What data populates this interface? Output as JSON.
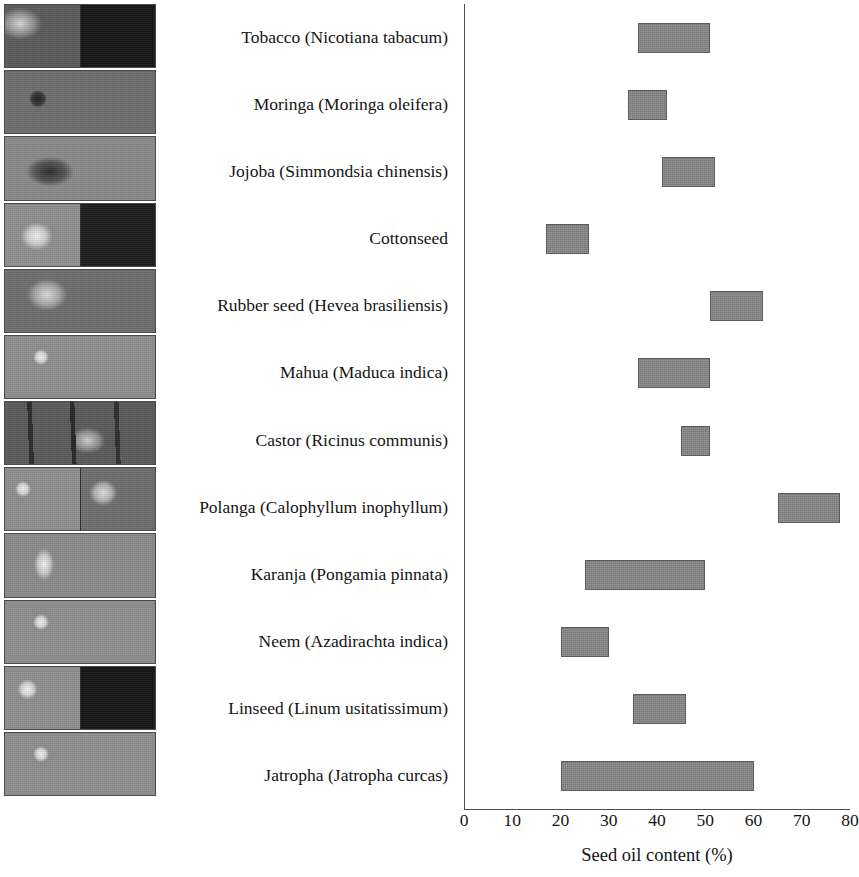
{
  "figure": {
    "kind": "range-bar-chart-with-photo-strip"
  },
  "photo_strip": {
    "name": "seed-and-plant-photographs",
    "cells": [
      {
        "id": "tobacco-photo",
        "panes": [
          "plant",
          "seeds"
        ]
      },
      {
        "id": "moringa-photo",
        "panes": [
          "pod-with-seeds"
        ]
      },
      {
        "id": "jojoba-photo",
        "panes": [
          "branch-with-fruit"
        ]
      },
      {
        "id": "cottonseed-photo",
        "panes": [
          "cotton-boll",
          "seed-pile"
        ]
      },
      {
        "id": "rubber-seed-photo",
        "panes": [
          "seeds-and-shells"
        ]
      },
      {
        "id": "mahua-photo",
        "panes": [
          "fruit-on-branch"
        ]
      },
      {
        "id": "castor-photo",
        "panes": [
          "castor-plant"
        ]
      },
      {
        "id": "polanga-photo",
        "panes": [
          "fruit-on-branch",
          "nuts"
        ]
      },
      {
        "id": "karanja-photo",
        "panes": [
          "pods-on-branch"
        ]
      },
      {
        "id": "neem-photo",
        "panes": [
          "fruit-on-branch"
        ]
      },
      {
        "id": "linseed-photo",
        "panes": [
          "flax-plant",
          "linseed-pile"
        ]
      },
      {
        "id": "jatropha-photo",
        "panes": [
          "fruit-on-branch"
        ]
      }
    ]
  },
  "chart_data": {
    "type": "bar",
    "subtype": "floating-range-bar",
    "title": "",
    "xlabel": "Seed oil content (%)",
    "ylabel": "",
    "xlim": [
      0,
      80
    ],
    "xticks": [
      0,
      10,
      20,
      30,
      40,
      50,
      60,
      70,
      80
    ],
    "xtick_labels": [
      "0",
      "10",
      "20",
      "30",
      "40",
      "50",
      "60",
      "70",
      "80"
    ],
    "grid": false,
    "legend": null,
    "bar_color": "#878787",
    "bar_edge_color": "#5c5c5c",
    "axis_color": "#4f4f4f",
    "categories": [
      "Tobacco (Nicotiana tabacum)",
      "Moringa (Moringa oleifera)",
      "Jojoba (Simmondsia chinensis)",
      "Cottonseed",
      "Rubber seed (Hevea brasiliensis)",
      "Mahua (Maduca indica)",
      "Castor (Ricinus communis)",
      "Polanga (Calophyllum inophyllum)",
      "Karanja (Pongamia pinnata)",
      "Neem (Azadirachta indica)",
      "Linseed (Linum usitatissimum)",
      "Jatropha (Jatropha curcas)"
    ],
    "ranges": [
      {
        "category": "Tobacco (Nicotiana tabacum)",
        "low": 36,
        "high": 51
      },
      {
        "category": "Moringa (Moringa oleifera)",
        "low": 34,
        "high": 42
      },
      {
        "category": "Jojoba (Simmondsia chinensis)",
        "low": 41,
        "high": 52
      },
      {
        "category": "Cottonseed",
        "low": 17,
        "high": 26
      },
      {
        "category": "Rubber seed (Hevea brasiliensis)",
        "low": 51,
        "high": 62
      },
      {
        "category": "Mahua (Maduca indica)",
        "low": 36,
        "high": 51
      },
      {
        "category": "Castor (Ricinus communis)",
        "low": 45,
        "high": 51
      },
      {
        "category": "Polanga (Calophyllum inophyllum)",
        "low": 65,
        "high": 78
      },
      {
        "category": "Karanja (Pongamia pinnata)",
        "low": 25,
        "high": 50
      },
      {
        "category": "Neem (Azadirachta indica)",
        "low": 20,
        "high": 30
      },
      {
        "category": "Linseed (Linum usitatissimum)",
        "low": 35,
        "high": 46
      },
      {
        "category": "Jatropha (Jatropha curcas)",
        "low": 20,
        "high": 60
      }
    ]
  }
}
